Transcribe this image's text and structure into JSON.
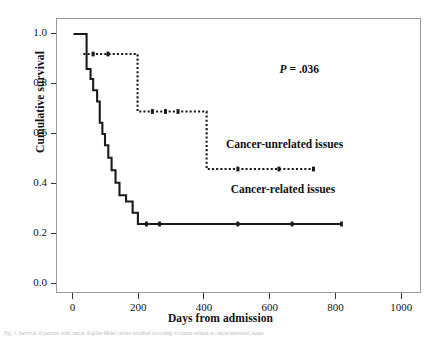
{
  "figure": {
    "width": 441,
    "height": 339,
    "background": "#ffffff",
    "caption": "Fig. 1. Survival of patients with cancer. Kaplan-Meier curves stratified according to cancer-related or cancer-unrelated issues."
  },
  "chart_data": {
    "type": "line",
    "subtype": "kaplan-meier-step",
    "title": "",
    "xlabel": "Days from admission",
    "ylabel": "Cumulative survival",
    "xlim": [
      -50,
      1060
    ],
    "ylim": [
      -0.04,
      1.06
    ],
    "xticks": [
      0,
      200,
      400,
      600,
      800,
      1000
    ],
    "xtick_labels": [
      "0",
      "200",
      "400",
      "600",
      "800",
      "1000"
    ],
    "yticks": [
      0.0,
      0.2,
      0.4,
      0.6,
      0.8,
      1.0
    ],
    "ytick_labels": [
      "0.0",
      "0.2",
      "0.4",
      "0.6",
      "0.8",
      "1.0"
    ],
    "grid": false,
    "legend": "inline-annotations",
    "annotations": [
      {
        "name": "p-value",
        "text_italic": "P",
        "text_rest": " =  .036",
        "x": 690,
        "y": 0.855
      },
      {
        "name": "cancer-unrelated-label",
        "text": "Cancer-unrelated issues",
        "x": 645,
        "y": 0.555
      },
      {
        "name": "cancer-related-label",
        "text": "Cancer-related issues",
        "x": 640,
        "y": 0.375
      }
    ],
    "series": [
      {
        "name": "Cancer-related issues",
        "style": "solid",
        "color": "#1a1a1a",
        "linewidth": 2.1,
        "points": [
          [
            0,
            1.0
          ],
          [
            40,
            1.0
          ],
          [
            40,
            0.86
          ],
          [
            52,
            0.86
          ],
          [
            52,
            0.82
          ],
          [
            60,
            0.82
          ],
          [
            60,
            0.775
          ],
          [
            72,
            0.775
          ],
          [
            72,
            0.73
          ],
          [
            80,
            0.73
          ],
          [
            80,
            0.645
          ],
          [
            88,
            0.645
          ],
          [
            88,
            0.6
          ],
          [
            96,
            0.6
          ],
          [
            96,
            0.555
          ],
          [
            106,
            0.555
          ],
          [
            106,
            0.505
          ],
          [
            116,
            0.505
          ],
          [
            116,
            0.455
          ],
          [
            128,
            0.455
          ],
          [
            128,
            0.405
          ],
          [
            140,
            0.405
          ],
          [
            140,
            0.355
          ],
          [
            160,
            0.355
          ],
          [
            160,
            0.33
          ],
          [
            180,
            0.33
          ],
          [
            180,
            0.285
          ],
          [
            196,
            0.285
          ],
          [
            196,
            0.24
          ],
          [
            815,
            0.24
          ]
        ],
        "censor_marks": [
          [
            222,
            0.24
          ],
          [
            262,
            0.24
          ],
          [
            500,
            0.24
          ],
          [
            665,
            0.24
          ],
          [
            815,
            0.24
          ]
        ]
      },
      {
        "name": "Cancer-unrelated issues",
        "style": "dotted",
        "color": "#1a1a1a",
        "linewidth": 2.1,
        "points": [
          [
            30,
            0.92
          ],
          [
            195,
            0.92
          ],
          [
            195,
            0.69
          ],
          [
            405,
            0.69
          ],
          [
            405,
            0.46
          ],
          [
            730,
            0.46
          ]
        ],
        "censor_marks": [
          [
            60,
            0.92
          ],
          [
            105,
            0.92
          ],
          [
            240,
            0.69
          ],
          [
            280,
            0.69
          ],
          [
            318,
            0.69
          ],
          [
            500,
            0.46
          ],
          [
            625,
            0.46
          ],
          [
            730,
            0.46
          ]
        ]
      }
    ]
  }
}
